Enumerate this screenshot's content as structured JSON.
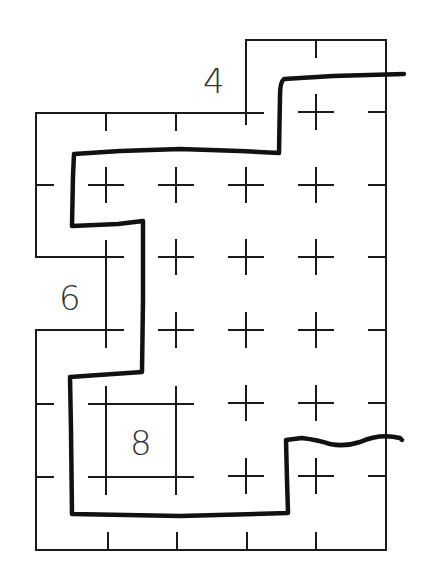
{
  "diagram": {
    "type": "grid-region-puzzle",
    "labels": [
      {
        "id": "label-4",
        "text": "4",
        "cell": [
          3,
          0
        ]
      },
      {
        "id": "label-6",
        "text": "6",
        "cell": [
          0,
          3
        ]
      },
      {
        "id": "label-8",
        "text": "8",
        "cell": [
          1,
          5
        ]
      }
    ],
    "grid": {
      "columns": 5,
      "rows": 7
    },
    "colors": {
      "line": "#1a1a1a",
      "boundary": "#111111",
      "text": "#333333",
      "background": "#ffffff"
    }
  }
}
